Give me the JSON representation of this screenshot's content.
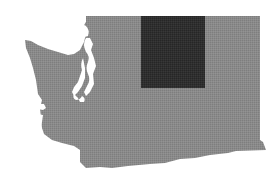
{
  "map": {
    "region": "Washington State",
    "highlight_label": "Highlighted region (north-central Washington)",
    "colors": {
      "background": "#ffffff",
      "state_fill": "#8a8a8a",
      "highlight_fill": "#2f2f2f",
      "water": "#ffffff"
    },
    "highlight_rect": {
      "x": 141,
      "y": 16,
      "width": 64,
      "height": 72
    }
  }
}
